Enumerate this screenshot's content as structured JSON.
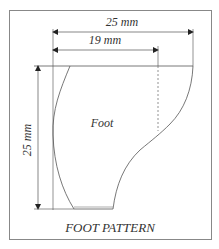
{
  "title": "FOOT PATTERN",
  "shape_label": "Foot",
  "dimensions": {
    "overall_width": "25 mm",
    "inner_width": "19 mm",
    "height": "25 mm"
  },
  "colors": {
    "line": "#555555",
    "frame": "#888888",
    "text": "#333333"
  }
}
